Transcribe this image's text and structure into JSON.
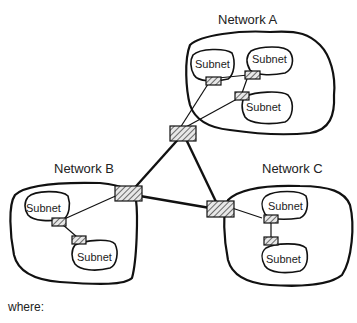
{
  "diagram": {
    "networks": [
      {
        "id": "A",
        "label": "Network A",
        "subnets": [
          "Subnet",
          "Subnet",
          "Subnet"
        ]
      },
      {
        "id": "B",
        "label": "Network B",
        "subnets": [
          "Subnet",
          "Subnet"
        ]
      },
      {
        "id": "C",
        "label": "Network C",
        "subnets": [
          "Subnet",
          "Subnet"
        ]
      }
    ],
    "labels": {
      "net_a": "Network A",
      "net_b": "Network B",
      "net_c": "Network C",
      "subnet": "Subnet"
    },
    "footer": "where:",
    "colors": {
      "stroke": "#111111",
      "background": "#ffffff"
    }
  }
}
